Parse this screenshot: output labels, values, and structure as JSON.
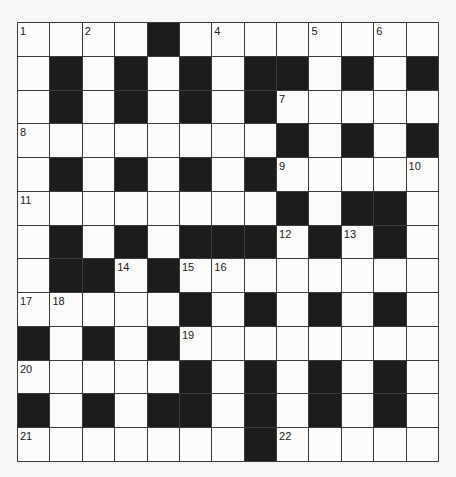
{
  "puzzle": {
    "rows": 13,
    "cols": 13,
    "colors": {
      "background": "#f6f6f4",
      "white_cell": "#fbfbfa",
      "black_cell": "#1c1c1c",
      "grid_line": "#3a3a3a",
      "number": "#222222"
    },
    "layout": [
      "....#........",
      ".#.#.#.##.#.#",
      ".#.#.#.#.....",
      "........#.#.#",
      ".#.#.#.#.....",
      "........#.##.",
      ".#.#.###.#.#.",
      ".##.#........",
      ".....#.#.#.#.",
      "#.#.#........",
      ".....#.#.#.#.",
      "#.#.##.#.#.#.",
      ".......#....."
    ],
    "numbers": [
      {
        "row": 0,
        "col": 0,
        "n": "1"
      },
      {
        "row": 0,
        "col": 2,
        "n": "2"
      },
      {
        "row": 0,
        "col": 4,
        "n": "3"
      },
      {
        "row": 0,
        "col": 6,
        "n": "4"
      },
      {
        "row": 0,
        "col": 9,
        "n": "5"
      },
      {
        "row": 0,
        "col": 11,
        "n": "6"
      },
      {
        "row": 2,
        "col": 8,
        "n": "7"
      },
      {
        "row": 3,
        "col": 0,
        "n": "8"
      },
      {
        "row": 4,
        "col": 8,
        "n": "9"
      },
      {
        "row": 4,
        "col": 12,
        "n": "10"
      },
      {
        "row": 5,
        "col": 0,
        "n": "11"
      },
      {
        "row": 6,
        "col": 8,
        "n": "12"
      },
      {
        "row": 6,
        "col": 10,
        "n": "13"
      },
      {
        "row": 7,
        "col": 3,
        "n": "14"
      },
      {
        "row": 7,
        "col": 5,
        "n": "15"
      },
      {
        "row": 7,
        "col": 6,
        "n": "16"
      },
      {
        "row": 8,
        "col": 0,
        "n": "17"
      },
      {
        "row": 8,
        "col": 1,
        "n": "18"
      },
      {
        "row": 9,
        "col": 5,
        "n": "19"
      },
      {
        "row": 10,
        "col": 0,
        "n": "20"
      },
      {
        "row": 12,
        "col": 0,
        "n": "21"
      },
      {
        "row": 12,
        "col": 8,
        "n": "22"
      }
    ]
  }
}
